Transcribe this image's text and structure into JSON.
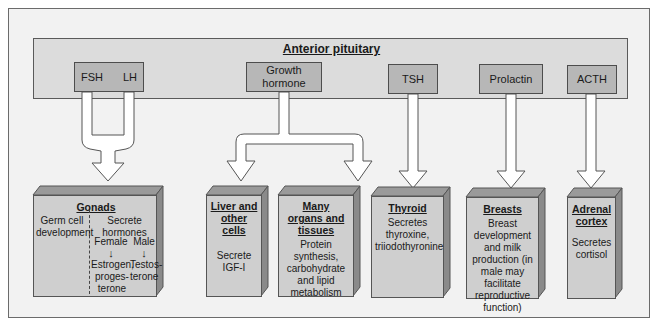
{
  "title": "Anterior pituitary",
  "pituitary_hormones": [
    {
      "id": "fsh",
      "label": "FSH"
    },
    {
      "id": "lh",
      "label": "LH"
    },
    {
      "id": "gh",
      "label": "Growth hormone"
    },
    {
      "id": "tsh",
      "label": "TSH"
    },
    {
      "id": "prolactin",
      "label": "Prolactin"
    },
    {
      "id": "acth",
      "label": "ACTH"
    }
  ],
  "targets": {
    "gonads": {
      "title": "Gonads",
      "left_text": "Germ cell development",
      "right_heading": "Secrete hormones",
      "female_label": "Female",
      "male_label": "Male",
      "female_hormones": "Estrogen, proges- terone",
      "male_hormones": "Testos- terone"
    },
    "liver": {
      "title": "Liver and other cells",
      "text": "Secrete IGF-I"
    },
    "organs": {
      "title": "Many organs and tissues",
      "text": "Protein synthesis, carbohydrate and lipid metabolism"
    },
    "thyroid": {
      "title": "Thyroid",
      "text": "Secretes thyroxine, triiodothyronine"
    },
    "breasts": {
      "title": "Breasts",
      "text": "Breast development and milk production (in male may facilitate reproductive function)"
    },
    "adrenal": {
      "title": "Adrenal cortex",
      "text": "Secretes cortisol"
    }
  },
  "colors": {
    "frame_bg": "#f2f2f2",
    "band_bg": "#dcdcdc",
    "hormone_box": "#b7b7b7",
    "target_front": "#cfcfcf",
    "target_top": "#9a9a9a",
    "target_side": "#8a8a8a",
    "arrow_fill": "#ffffff"
  }
}
